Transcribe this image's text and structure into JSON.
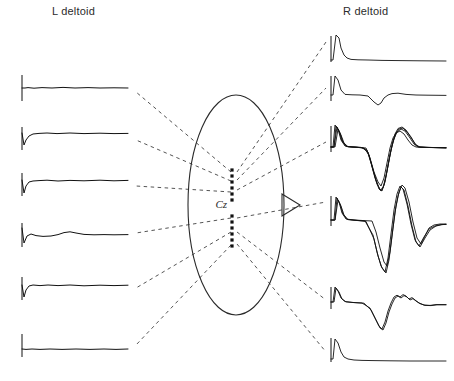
{
  "figure": {
    "kind": "scalp-map-with-emg-traces",
    "labels": {
      "left_channel": "L deltoid",
      "right_channel": "R deltoid",
      "vertex_site": "Cz"
    },
    "colors": {
      "trace": "#111111",
      "head_outline": "#2a2a2a",
      "dashed_link": "#555555",
      "electrode_dot": "#111111",
      "background": "#ffffff",
      "text": "#2b2b2b"
    },
    "head": {
      "shape": "ellipse",
      "center_x": 236,
      "center_y": 205,
      "radius_x": 48,
      "radius_y": 110,
      "nose_marker": "triangle-pointing-right",
      "nose_x": 284,
      "nose_y": 205
    },
    "electrode_column": {
      "x": 232,
      "dot_size": 3.2,
      "sites_above_label": 6,
      "sites_below_label": 6,
      "y_positions": [
        170,
        176,
        182,
        188,
        194,
        200,
        216,
        222,
        228,
        234,
        240,
        246
      ],
      "label_y": 208
    },
    "left_traces": {
      "channel": "L deltoid",
      "baseline_x_start": 22,
      "baseline_x_end": 128,
      "count": 6,
      "traces": [
        {
          "index": 0,
          "baseline_y": 88,
          "cal_bar_top": 75,
          "cal_bar_bottom": 101,
          "shape": "flat-with-small-artifact",
          "points": "22,88 25,88 28,87.6 34,88.2 42,87.6 52,88 63,87.4 75,88 88,87.6 100,88 114,87.8 128,88"
        },
        {
          "index": 1,
          "baseline_y": 137,
          "cal_bar_top": 127,
          "cal_bar_bottom": 150,
          "shape": "small-negative-onset-then-flat",
          "points": "22,133 24,145 26,140 29,136 33,134 39,133.4 47,133 57,133.6 70,133 84,133.6 100,133.2 114,133.6 128,133.4"
        },
        {
          "index": 2,
          "baseline_y": 184,
          "cal_bar_top": 173,
          "cal_bar_bottom": 196,
          "shape": "sharp-onset-then-flat",
          "points": "22,180 24,193 26,186 29,182 33,181 39,180.6 47,180.2 58,181 70,180.4 84,180.8 100,180.2 114,180.8 128,180.4"
        },
        {
          "index": 3,
          "baseline_y": 235,
          "cal_bar_top": 223,
          "cal_bar_bottom": 247,
          "shape": "low-amplitude-biphasic-ripple",
          "points": "22,228 24,243 27,236 31,234 36,235.6 43,236.4 51,236 58,234.6 64,232.6 70,231.8 76,233 84,234.4 94,234.8 104,234.6 114,234.8 128,234.6"
        },
        {
          "index": 4,
          "baseline_y": 288,
          "cal_bar_top": 277,
          "cal_bar_bottom": 300,
          "shape": "sharp-onset-then-flat",
          "points": "22,285 24,297 26,290 29,286 33,285 40,285.6 48,285 58,285.6 70,285 84,285.8 100,285.2 114,285.6 128,285.2"
        },
        {
          "index": 5,
          "baseline_y": 348,
          "cal_bar_top": 334,
          "cal_bar_bottom": 357,
          "shape": "flat",
          "points": "22,349 26,349.4 32,349 40,349.4 50,349 62,349.4 76,349 90,349.4 104,349 116,349.4 128,349"
        }
      ]
    },
    "right_traces": {
      "channel": "R deltoid",
      "baseline_x_start": 331,
      "baseline_x_end": 446,
      "count": 6,
      "traces": [
        {
          "index": 0,
          "baseline_y": 58,
          "cal_bar_top": 36,
          "cal_bar_bottom": 62,
          "shape": "large-monophasic-stimulus-artifact",
          "sweeps": [
            "331,60 333,60 336,35 339,38 341,48 344,55 347,58 351,59.4 358,59.8 368,60 382,60.4 400,60.6 420,60.8 446,61"
          ]
        },
        {
          "index": 1,
          "baseline_y": 95,
          "cal_bar_top": 76,
          "cal_bar_bottom": 101,
          "shape": "artifact-then-small-negative-mep",
          "sweeps": [
            "331,95 333,95 335,76 338,80 341,90 345,94.4 352,94.8 360,95 368,96 374,102 378,105 381,103 384,98 388,95 392,93.6 398,93.2 406,94.4 416,95 428,95.2 446,95.4"
          ]
        },
        {
          "index": 2,
          "baseline_y": 148,
          "cal_bar_top": 126,
          "cal_bar_bottom": 152,
          "shape": "large-biphasic-mep-multiple-sweeps",
          "sweeps": [
            "331,147 333,147 335,125 338,129 341,140 345,146 352,147 360,147.6 366,148 370,158 374,172 378,182 381,186 384,178 387,163 390,148 393,138 396,133 400,131 404,134 408,140 412,145 416,147 424,147.4 434,147.6 446,147.8",
            "331,147 334,147 336,126 339,131 342,141 346,146.4 353,147 361,147.4 367,150 371,163 375,178 379,189 382,191 385,182 388,166 391,150 394,139 397,132 401,129 405,131 410,138 414,144 418,147 426,147.4 436,147.6 446,147.8",
            "331,147 334,147 337,127 340,133 343,142 347,146.6 354,147 362,147.6 368,152 372,166 376,180 380,190 383,188 386,176 389,160 392,145 395,134 398,128.5 402,127 406,130 411,137 415,144 419,147 427,147.4 437,147.6 446,147.8",
            "331,147 335,147 338,129 341,135 344,143 348,146.8 356,147.2 364,148 369,155 373,170 377,184 381,191 384,185 387,171 390,155 393,142 396,133 399,129 403,128 407,132 412,139 416,145 420,147 428,147.4 438,147.6 446,147.8"
          ]
        },
        {
          "index": 3,
          "baseline_y": 222,
          "cal_bar_top": 196,
          "cal_bar_bottom": 226,
          "shape": "very-large-biphasic-mep-multiple-sweeps",
          "sweeps": [
            "331,220 334,220 336,197 339,202 342,213 346,219 354,220 364,220.6 372,221 376,232 380,248 384,262 387,266 390,252 393,228 396,206 399,192 402,185 405,188 409,202 413,222 417,238 421,244 425,236 429,228 434,225 440,224 446,224",
            "331,220 335,220 337,198 340,204 343,214 347,219.4 355,220.2 365,221 373,235 377,252 381,266 385,272 388,258 391,234 394,210 397,194 400,186 403,189 407,204 411,224 415,240 419,246 424,237 429,229 435,226 441,224.6 446,224.4",
            "331,220 335,220.2 338,200 341,206 344,215 348,219.6 356,220.4 366,221.4 374,239 378,256 382,268 386,273 389,260 392,236 395,212 398,196 401,187 404,190 408,206 412,226 416,242 420,247 425,238 430,230 436,226 442,224.6 446,224.4"
          ]
        },
        {
          "index": 4,
          "baseline_y": 303,
          "cal_bar_top": 287,
          "cal_bar_bottom": 309,
          "shape": "artifact-then-negative-mep-with-polyphasic-tail",
          "sweeps": [
            "331,302 333,302 335,287 338,291 341,298 345,301.6 352,302.4 362,303 370,308 375,318 379,326 382,329 385,322 388,311 391,303 394,297 397,295.2 400,297 403,294.6 406,296 409,299 412,297.6 415,300 419,303 424,305 430,305.4 436,304.6 446,304.6",
            "331,302 334,302 336,288 339,292 342,299 346,301.8 354,302.6 364,303.2 371,310 376,320 380,328 383,330 386,323 389,312 392,304 395,298 398,296 401,298 404,295.6 407,297 410,300 413,298.6 416,301 420,303.6 425,305.4 431,305.6 437,304.8 446,304.8"
          ]
        },
        {
          "index": 5,
          "baseline_y": 358,
          "cal_bar_top": 338,
          "cal_bar_bottom": 362,
          "shape": "artifact-only-no-mep",
          "sweeps": [
            "331,359 333,359 335,339 338,343 341,352 344,357 348,359 354,360 362,360.4 374,360.6 390,360.8 410,361 430,361 446,361"
          ]
        }
      ]
    },
    "dashed_links": {
      "description": "Dashed lines fanning from the midline electrode column out to each trace",
      "to_left": [
        {
          "from_x": 231,
          "from_y": 172,
          "to_x": 136,
          "to_y": 92
        },
        {
          "from_x": 231,
          "from_y": 181,
          "to_x": 136,
          "to_y": 140
        },
        {
          "from_x": 231,
          "from_y": 192,
          "to_x": 136,
          "to_y": 186
        },
        {
          "from_x": 231,
          "from_y": 218,
          "to_x": 136,
          "to_y": 233
        },
        {
          "from_x": 231,
          "from_y": 232,
          "to_x": 136,
          "to_y": 288
        },
        {
          "from_x": 231,
          "from_y": 245,
          "to_x": 136,
          "to_y": 345
        }
      ],
      "to_right": [
        {
          "from_x": 237,
          "from_y": 172,
          "to_x": 326,
          "to_y": 42
        },
        {
          "from_x": 237,
          "from_y": 180,
          "to_x": 326,
          "to_y": 88
        },
        {
          "from_x": 237,
          "from_y": 190,
          "to_x": 326,
          "to_y": 142
        },
        {
          "from_x": 237,
          "from_y": 218,
          "to_x": 326,
          "to_y": 202
        },
        {
          "from_x": 237,
          "from_y": 232,
          "to_x": 326,
          "to_y": 300
        },
        {
          "from_x": 237,
          "from_y": 244,
          "to_x": 326,
          "to_y": 352
        }
      ]
    }
  }
}
